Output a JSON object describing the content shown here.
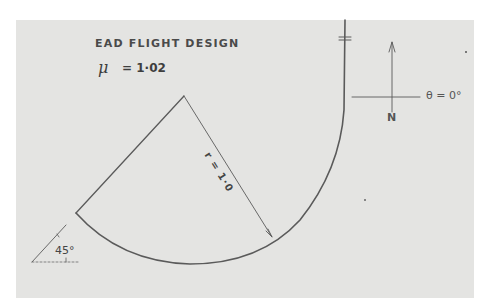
{
  "diagram": {
    "title": "EAD FLIGHT DESIGN",
    "mu_symbol": "μ",
    "mu_value": "= 1·02",
    "radius_label": "r = 1·0",
    "angle_label": "45°",
    "heading_label": "θ = 0°",
    "north_label": "N",
    "colors": {
      "paper": "#e4e4e2",
      "background": "#ffffff",
      "ink": "#5a5a5a"
    }
  }
}
